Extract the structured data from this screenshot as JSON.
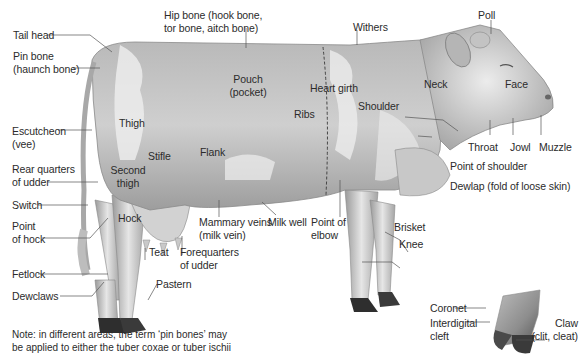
{
  "diagram": {
    "labels": {
      "tail_head": "Tail head",
      "pin_bone": [
        "Pin bone",
        "(haunch bone)"
      ],
      "hip_bone": [
        "Hip bone (hook bone,",
        "tor bone, aitch bone)"
      ],
      "withers": "Withers",
      "poll": "Poll",
      "pouch": [
        "Pouch",
        "(pocket)"
      ],
      "heart_girth": "Heart girth",
      "ribs": "Ribs",
      "shoulder": "Shoulder",
      "neck": "Neck",
      "face": "Face",
      "escutcheon": [
        "Escutcheon",
        "(vee)"
      ],
      "thigh": "Thigh",
      "stifle": "Stifle",
      "flank": "Flank",
      "second_thigh": [
        "Second",
        "thigh"
      ],
      "rear_quarters": [
        "Rear quarters",
        "of udder"
      ],
      "throat": "Throat",
      "jowl": "Jowl",
      "muzzle": "Muzzle",
      "point_of_shoulder": "Point of shoulder",
      "dewlap": "Dewlap (fold of loose skin)",
      "switch": "Switch",
      "hock": "Hock",
      "point_of_hock": [
        "Point",
        "of hock"
      ],
      "mammary_veins": [
        "Mammary veins",
        "(milk vein)"
      ],
      "milk_well": "Milk well",
      "point_of_elbow": [
        "Point of",
        "elbow"
      ],
      "brisket": "Brisket",
      "knee": "Knee",
      "teat": "Teat",
      "forequarters": [
        "Forequarters",
        "of udder"
      ],
      "fetlock": "Fetlock",
      "dewclaws": "Dewclaws",
      "pastern": "Pastern",
      "coronet": "Coronet",
      "interdigital_cleft": [
        "Interdigital",
        "cleft"
      ],
      "claw": [
        "Claw",
        "(clit, cleat)"
      ]
    },
    "note": [
      "Note: in different areas, the term ‘pin bones’ may",
      "be applied to either the tuber coxae or tuber ischii"
    ],
    "colors": {
      "leader_line": "#555555",
      "body_light": "#e4e4e4",
      "body_dark": "#8a8a8a",
      "hoof": "#2a2a2a"
    }
  }
}
